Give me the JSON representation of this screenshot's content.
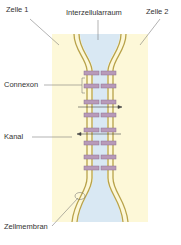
{
  "diagram": {
    "labels": {
      "cell1": "Zelle 1",
      "intercellular": "Interzellularraum",
      "cell2": "Zelle 2",
      "connexon": "Connexon",
      "channel": "Kanal",
      "membrane": "Zellmembran"
    },
    "colors": {
      "cytoplasm": "#fdf8d8",
      "intercellular_space": "#d9e8f3",
      "membrane": "#b8a24a",
      "connexon": "#b89ab8",
      "connexon_border": "#8d6f92",
      "leader_line": "#555555"
    }
  }
}
